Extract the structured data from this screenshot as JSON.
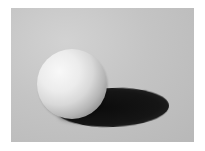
{
  "image": {
    "description": "Rendered white sphere casting an elliptical dark shadow to the right on a light gray surface",
    "colors": {
      "background": "#c4c4c4",
      "border": "#ffffff",
      "sphere_highlight": "#f8f8f8",
      "sphere_core_shadow": "#8c8c8c",
      "cast_shadow": "#111111"
    },
    "objects": [
      {
        "name": "sphere",
        "center": [
          72,
          84
        ],
        "radius": 35
      },
      {
        "name": "cast-shadow",
        "bbox": [
          56,
          88,
          168,
          127
        ]
      }
    ]
  }
}
